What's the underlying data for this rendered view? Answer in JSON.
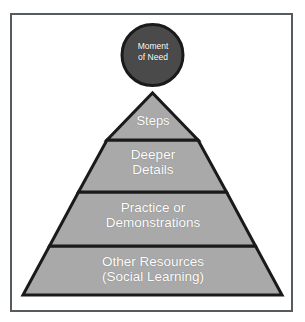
{
  "diagram": {
    "type": "pyramid",
    "background_color": "#ffffff",
    "frame_color": "#555b5e",
    "tier_fill_color": "#a9a9a9",
    "tier_outline_color": "#1a1a1a",
    "label_color": "#ffffff",
    "apex": {
      "shape": "circle",
      "name": "moment-of-need",
      "label": "Moment\nof Need",
      "label_line_1": "Moment",
      "label_line_2": "of Need",
      "fill_color": "#4a4a4a",
      "outline_color": "#1a1a1a"
    },
    "tiers": [
      {
        "index": 1,
        "name": "steps",
        "label": "Steps",
        "label_lines": [
          "Steps"
        ]
      },
      {
        "index": 2,
        "name": "deeper-details",
        "label": "Deeper\nDetails",
        "label_lines": [
          "Deeper",
          "Details"
        ]
      },
      {
        "index": 3,
        "name": "practice-or-demonstrations",
        "label": "Practice or\nDemonstrations",
        "label_lines": [
          "Practice or",
          "Demonstrations"
        ]
      },
      {
        "index": 4,
        "name": "other-resources",
        "label": "Other Resources\n(Social Learning)",
        "label_lines": [
          "Other Resources",
          "(Social Learning)"
        ]
      }
    ]
  }
}
